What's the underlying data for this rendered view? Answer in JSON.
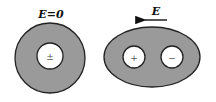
{
  "diagram": {
    "left": {
      "label": "E=0",
      "inner_sign": "±",
      "shape": "circle",
      "fill": "#9a9a9a"
    },
    "right": {
      "field_label": "E",
      "field_direction": "left",
      "shape": "ellipse",
      "inner_signs": [
        "+",
        "−"
      ],
      "fill": "#9a9a9a"
    }
  }
}
